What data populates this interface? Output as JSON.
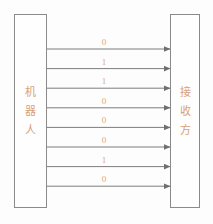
{
  "diagram": {
    "background_color": "#fdfdfd",
    "line_color": "#7d7d7d",
    "box_border_color": "#8a8a8a",
    "text_color": "#d9a077",
    "left_node": {
      "name": "sender-node",
      "label": "机器人",
      "characters": [
        "机",
        "器",
        "人"
      ]
    },
    "right_node": {
      "name": "receiver-node",
      "label": "接收方",
      "characters": [
        "接",
        "收",
        "方"
      ]
    },
    "transmission": {
      "direction": "left-to-right",
      "arrow_count": 8,
      "bits": [
        "0",
        "1",
        "1",
        "0",
        "0",
        "0",
        "1",
        "0"
      ],
      "bitstring": "01100010"
    }
  }
}
